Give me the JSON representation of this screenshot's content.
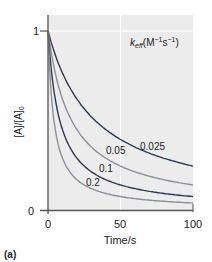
{
  "chart_data": {
    "type": "line",
    "title": "",
    "panel_label": "(a)",
    "xlabel": "Time/s",
    "ylabel": "[A]/[A]0",
    "xlim": [
      0,
      100
    ],
    "ylim": [
      0,
      1
    ],
    "x_ticks": [
      "0",
      "50",
      "100"
    ],
    "y_ticks": [
      "0",
      "1"
    ],
    "grid": true,
    "legend_title": "keff(M−1s−1)",
    "series": [
      {
        "name": "0.025",
        "k": 0.025,
        "color": "#2a3a55",
        "label_pos": [
          0.5,
          0.33
        ]
      },
      {
        "name": "0.05",
        "k": 0.05,
        "color": "#8a8f99",
        "label_pos": [
          0.45,
          0.2
        ]
      },
      {
        "name": "0.1",
        "k": 0.1,
        "color": "#2a3a55",
        "label_pos": [
          0.37,
          0.13
        ]
      },
      {
        "name": "0.2",
        "k": 0.2,
        "color": "#8a8f99",
        "label_pos": [
          0.28,
          0.08
        ]
      }
    ],
    "x": [
      0,
      10,
      20,
      30,
      40,
      50,
      60,
      70,
      80,
      90,
      100
    ],
    "values_note": "[A]/[A]0 = 1/(1 + 123*k*t/100) approx",
    "values": {
      "0.025": [
        1.0,
        0.76,
        0.62,
        0.52,
        0.45,
        0.39,
        0.35,
        0.32,
        0.29,
        0.27,
        0.245
      ],
      "0.05": [
        1.0,
        0.62,
        0.45,
        0.35,
        0.29,
        0.25,
        0.21,
        0.19,
        0.17,
        0.15,
        0.14
      ],
      "0.1": [
        1.0,
        0.45,
        0.29,
        0.21,
        0.17,
        0.14,
        0.12,
        0.1,
        0.09,
        0.08,
        0.075
      ],
      "0.2": [
        1.0,
        0.29,
        0.17,
        0.12,
        0.09,
        0.075,
        0.06,
        0.055,
        0.048,
        0.043,
        0.039
      ]
    }
  }
}
